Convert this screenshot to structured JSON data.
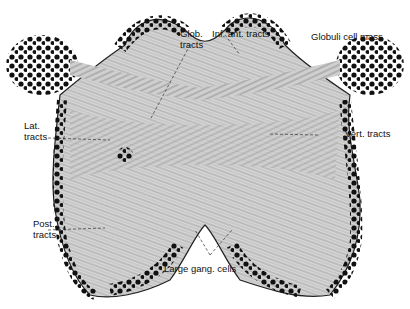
{
  "figure": {
    "type": "anatomical-illustration",
    "colors": {
      "ink": "#111111",
      "background": "#ffffff",
      "tissue": "#bdbdbd"
    }
  },
  "labels": {
    "glob_tracts": "Glob.\ntracts",
    "inf_ant_tracts": "Inf. ant. tracts",
    "globuli_cell_mass": "Globuli cell mass",
    "lat_tracts": "Lat.\ntracts",
    "vert_tracts": "Vert. tracts",
    "post_tracts": "Post.\ntracts",
    "large_gang_cells": "Large gang. cells"
  }
}
